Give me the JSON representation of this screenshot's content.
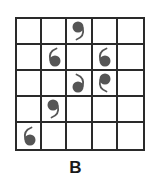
{
  "figure": {
    "label": "B",
    "rows": 5,
    "cols": 5,
    "colors": {
      "grid_line": "#2a2a2a",
      "glyph": "#555555",
      "background": "#ffffff"
    },
    "glyph_types": {
      "nine": "comma shape, dot on top, tail curving down-left",
      "six": "opening-quote shape, dot on bottom, tail curving up-left",
      "six-mirrored": "dot on bottom, tail curving up-right",
      "nine-mirrored": "dot on top, tail curving down-right"
    },
    "glyphs": [
      {
        "row": 0,
        "col": 2,
        "type": "nine"
      },
      {
        "row": 1,
        "col": 1,
        "type": "six"
      },
      {
        "row": 1,
        "col": 3,
        "type": "six"
      },
      {
        "row": 2,
        "col": 2,
        "type": "six-mirrored"
      },
      {
        "row": 2,
        "col": 3,
        "type": "nine-mirrored"
      },
      {
        "row": 3,
        "col": 1,
        "type": "nine"
      },
      {
        "row": 4,
        "col": 0,
        "type": "six"
      }
    ]
  }
}
